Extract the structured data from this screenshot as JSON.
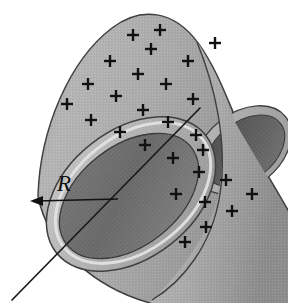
{
  "figure": {
    "radius_label": "R",
    "charge_symbol": "+",
    "charge_sign": "positive",
    "background_color": "#ffffff"
  },
  "geometry": {
    "cylinder": {
      "near_end_center": [
        131,
        194
      ],
      "near_end_rx_outer": 93,
      "near_end_ry_outer": 63,
      "near_end_rx_inner": 78,
      "near_end_ry_inner": 50,
      "near_end_rotation_deg": -39,
      "far_end_center": [
        243,
        148
      ],
      "far_end_rx_outer": 52,
      "far_end_ry_outer": 36,
      "far_end_rx_inner": 43,
      "far_end_ry_inner": 28,
      "far_end_rotation_deg": -39
    },
    "axis_line": {
      "start": [
        12,
        300
      ],
      "end": [
        265,
        42
      ],
      "stroke": "#1a1a1a",
      "width": 1.6
    },
    "radius_arrow": {
      "tail": [
        116,
        199
      ],
      "head": [
        33,
        201
      ],
      "label_position": [
        57,
        175
      ]
    }
  },
  "colors": {
    "outer_surface_light": "#b4b4b4",
    "outer_surface_mid": "#9e9e9e",
    "outer_surface_dark": "#8a8a8a",
    "rim_highlight": "#dcdcdc",
    "rim_face": "#a8a8a8",
    "interior_dark": "#6e6e6e",
    "interior_darker": "#5a5a5a",
    "far_interior": "#5c5c5c",
    "outline": "#3a3a3a",
    "ink": "#111111"
  },
  "charges": [
    {
      "x": 133,
      "y": 35
    },
    {
      "x": 160,
      "y": 30
    },
    {
      "x": 110,
      "y": 61
    },
    {
      "x": 188,
      "y": 61
    },
    {
      "x": 138,
      "y": 74
    },
    {
      "x": 166,
      "y": 84
    },
    {
      "x": 88,
      "y": 84
    },
    {
      "x": 215,
      "y": 43
    },
    {
      "x": 116,
      "y": 96
    },
    {
      "x": 193,
      "y": 99
    },
    {
      "x": 91,
      "y": 120
    },
    {
      "x": 143,
      "y": 110
    },
    {
      "x": 168,
      "y": 122
    },
    {
      "x": 120,
      "y": 132
    },
    {
      "x": 196,
      "y": 135
    },
    {
      "x": 145,
      "y": 145
    },
    {
      "x": 173,
      "y": 158
    },
    {
      "x": 203,
      "y": 150
    },
    {
      "x": 226,
      "y": 180
    },
    {
      "x": 199,
      "y": 172
    },
    {
      "x": 176,
      "y": 194
    },
    {
      "x": 205,
      "y": 202
    },
    {
      "x": 232,
      "y": 211
    },
    {
      "x": 206,
      "y": 227
    },
    {
      "x": 185,
      "y": 242
    },
    {
      "x": 252,
      "y": 194
    },
    {
      "x": 67,
      "y": 104
    },
    {
      "x": 151,
      "y": 49
    }
  ],
  "annotations": {
    "radius_meaning": "R is the radius of the cylinder, measured from the axis to the wall",
    "axis_meaning": "straight line through the cylinder axis"
  }
}
